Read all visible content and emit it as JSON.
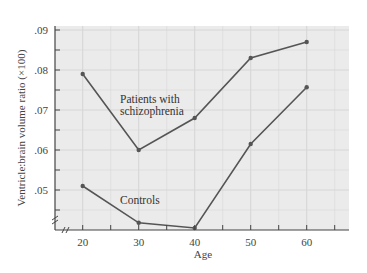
{
  "chart_data": {
    "type": "line",
    "title": "",
    "xlabel": "Age",
    "ylabel": "Ventricle:brain volume ratio (×100)",
    "x": [
      20,
      30,
      40,
      50,
      60
    ],
    "xlim": [
      15,
      67
    ],
    "ylim": [
      0.045,
      0.09
    ],
    "x_ticks": [
      "20",
      "30",
      "40",
      "50",
      "60"
    ],
    "y_ticks": [
      ".05",
      ".06",
      ".07",
      ".08",
      ".09"
    ],
    "grid": true,
    "axis_breaks": [
      "x",
      "y"
    ],
    "legend_position": "inline annotations",
    "series": [
      {
        "name": "Patients with schizophrenia",
        "label_lines": [
          "Patients with",
          "schizophrenia"
        ],
        "values": [
          0.079,
          0.06,
          0.068,
          0.083,
          0.087
        ]
      },
      {
        "name": "Controls",
        "label_lines": [
          "Controls"
        ],
        "values": [
          0.051,
          0.0418,
          0.0405,
          0.0615,
          0.0757
        ]
      }
    ]
  },
  "colors": {
    "plot_background": "#ebebeb",
    "grid": "#d6d6d6",
    "line": "#555555",
    "axis": "#444444"
  }
}
